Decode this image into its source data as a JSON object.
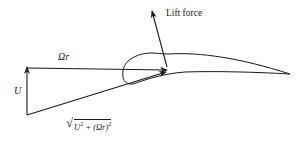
{
  "diagram": {
    "type": "blade-element velocity/force diagram",
    "colors": {
      "stroke": "#1a1a1a",
      "background": "#ffffff"
    },
    "labels": {
      "lift": "Lift force",
      "rotational_velocity": "Ωr",
      "axial_velocity": "U",
      "resultant_radicand_u": "U",
      "resultant_plus": " + (Ωr)",
      "exp": "2",
      "resultant_full": "√(U² + (Ωr)²)"
    },
    "elements": [
      {
        "name": "axial-velocity-arrow",
        "label": "U",
        "from": [
          27,
          115
        ],
        "to": [
          27,
          68
        ]
      },
      {
        "name": "rotational-velocity-arrow",
        "label": "Ωr",
        "from": [
          27,
          68
        ],
        "to": [
          167,
          70
        ]
      },
      {
        "name": "resultant-velocity-arrow",
        "label": "√(U² + (Ωr)²)",
        "from": [
          27,
          115
        ],
        "to": [
          166,
          72
        ]
      },
      {
        "name": "lift-force-arrow",
        "label": "Lift force",
        "from": [
          167,
          67
        ],
        "to": [
          152,
          12
        ]
      },
      {
        "name": "airfoil",
        "label": ""
      }
    ]
  }
}
